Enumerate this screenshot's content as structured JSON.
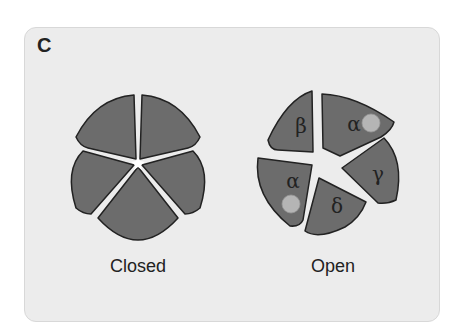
{
  "panel": {
    "label": "C"
  },
  "closed": {
    "caption": "Closed",
    "subunits": 5
  },
  "open": {
    "caption": "Open",
    "subunits": [
      {
        "label": "β",
        "ligand": false
      },
      {
        "label": "α",
        "ligand": true
      },
      {
        "label": "γ",
        "ligand": false
      },
      {
        "label": "δ",
        "ligand": false
      },
      {
        "label": "α",
        "ligand": true
      }
    ]
  },
  "colors": {
    "subunit": "#6c6c6c",
    "outline": "#222222",
    "ligand": "#b5b5b5",
    "panel": "#ececec"
  }
}
